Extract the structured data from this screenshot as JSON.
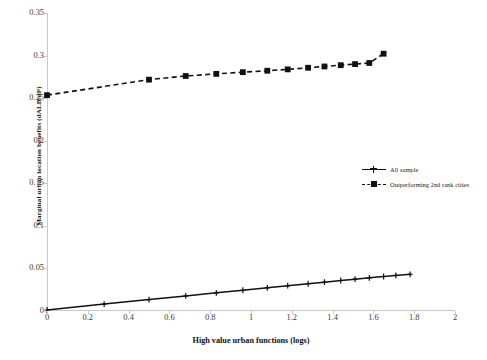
{
  "chart_data": {
    "type": "line",
    "title": "",
    "xlabel": "High value urban functions (logs)",
    "ylabel": "Marginal urban location benefits (dALB/dP)",
    "xlim": [
      0,
      2
    ],
    "ylim": [
      0,
      0.35
    ],
    "xticks": [
      "0",
      "0.2",
      "0.4",
      "0.6",
      "0.8",
      "1",
      "1.2",
      "1.4",
      "1.6",
      "1.8",
      "2"
    ],
    "xtick_values": [
      0,
      0.2,
      0.4,
      0.6,
      0.8,
      1,
      1.2,
      1.4,
      1.6,
      1.8,
      2
    ],
    "yticks": [
      "0",
      "0.05",
      "0.1",
      "0.15",
      "0.2",
      "0.25",
      "0.3",
      "0.35"
    ],
    "ytick_values": [
      0,
      0.05,
      0.1,
      0.15,
      0.2,
      0.25,
      0.3,
      0.35
    ],
    "grid": false,
    "legend_position": "right-middle",
    "series": [
      {
        "name": "All sample",
        "style": "solid",
        "marker": "cross",
        "color": "#111111",
        "x": [
          0,
          0.28,
          0.5,
          0.68,
          0.83,
          0.96,
          1.08,
          1.18,
          1.28,
          1.36,
          1.44,
          1.51,
          1.58,
          1.65,
          1.71,
          1.78
        ],
        "y": [
          0.0012,
          0.0081,
          0.0134,
          0.0177,
          0.0213,
          0.0244,
          0.0272,
          0.0297,
          0.032,
          0.0339,
          0.0358,
          0.0374,
          0.039,
          0.0405,
          0.0418,
          0.0431
        ]
      },
      {
        "name": "Outperforming 2nd rank cities",
        "style": "dashed",
        "marker": "square",
        "color": "#111111",
        "x": [
          0,
          0.5,
          0.68,
          0.83,
          0.96,
          1.08,
          1.18,
          1.28,
          1.36,
          1.44,
          1.51,
          1.58,
          1.65
        ],
        "y": [
          0.2535,
          0.2717,
          0.276,
          0.2785,
          0.2805,
          0.2822,
          0.2838,
          0.2857,
          0.2872,
          0.2887,
          0.29,
          0.2913,
          0.3022
        ]
      }
    ],
    "legend": [
      {
        "label": "All sample",
        "style": "solid",
        "marker": "cross"
      },
      {
        "label": "Outperforming 2nd rank cities",
        "style": "dashed",
        "marker": "square"
      }
    ]
  }
}
